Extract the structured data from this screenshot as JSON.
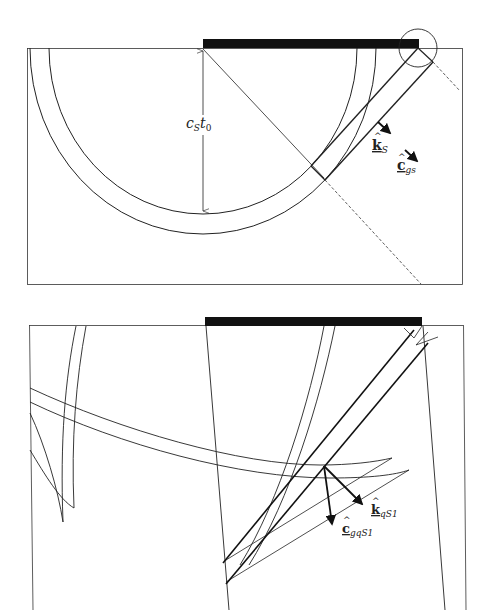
{
  "figure": {
    "panels": [
      {
        "id": "top",
        "description": "Semicircular S-wavefront from a surface source with head/plane wave strip",
        "labels": {
          "radius": "c",
          "radius_sub": "S",
          "radius_t": "t",
          "radius_t_sub": "0",
          "wave_vector": "k",
          "wave_vector_sub": "S",
          "group_velocity": "c",
          "group_velocity_sub": "gs"
        }
      },
      {
        "id": "bottom",
        "description": "Wavefronts with cusps; quasi-S wave vector and group velocity arrows",
        "labels": {
          "wave_vector": "k",
          "wave_vector_sub": "qS1",
          "group_velocity": "c",
          "group_velocity_sub": "gqS1"
        }
      }
    ],
    "colors": {
      "line": "#222222",
      "source_bar": "#111111",
      "background": "#ffffff"
    }
  }
}
